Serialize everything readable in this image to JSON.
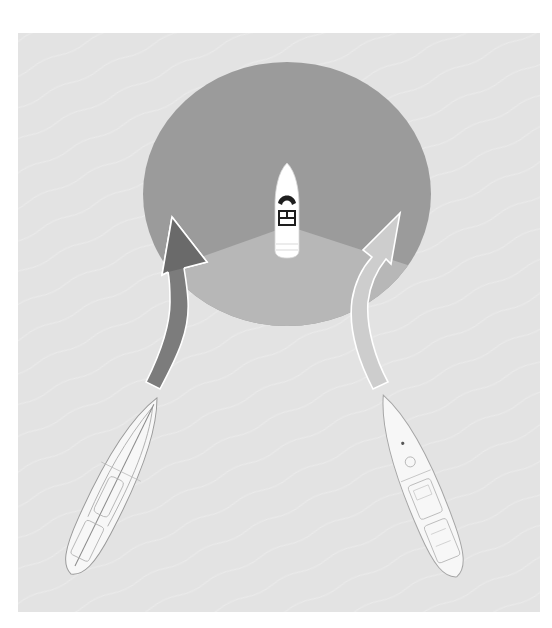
{
  "diagram": {
    "colors": {
      "background": "#ffffff",
      "water": "#e3e3e3",
      "circle_dark": "#9b9b9b",
      "sector_light": "#b7b7b7",
      "arrow_left_fill": "#7c7c7c",
      "arrow_left_head": "#6a6a6a",
      "arrow_right_fill": "#cdcdcd",
      "arrow_outline": "#ffffff",
      "boat_hull": "#ffffff",
      "boat_detail": "#1e1e1e",
      "sailboat_line": "#9a9a9a"
    },
    "elements": {
      "water_panel": {
        "x": 18,
        "y": 33,
        "width": 522,
        "height": 579
      },
      "visibility_circle": {
        "cx": 287,
        "cy": 194,
        "rx": 144,
        "ry": 132
      },
      "light_sector": {
        "apex": [
          288,
          226
        ],
        "left_edge": [
          146,
          276
        ],
        "right_edge": [
          428,
          271
        ]
      },
      "powerboat": {
        "label": "powerboat",
        "x": 275,
        "y": 163,
        "width": 24,
        "height": 95
      },
      "left_sailboat": {
        "label": "sailboat-left",
        "bow": [
          156,
          392
        ],
        "stern": [
          72,
          580
        ]
      },
      "right_sailboat": {
        "label": "sailboat-right",
        "bow": [
          382,
          392
        ],
        "stern": [
          458,
          580
        ]
      },
      "left_arrow": {
        "label": "left-course-arrow",
        "tip": [
          172,
          217
        ]
      },
      "right_arrow": {
        "label": "right-course-arrow",
        "tip": [
          400,
          213
        ]
      }
    }
  }
}
